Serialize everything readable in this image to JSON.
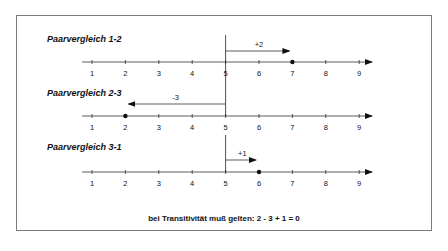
{
  "diagram": {
    "panels": [
      {
        "title": "Paarvergleich 1-2",
        "label": "+2",
        "start": 5,
        "end": 7,
        "point": 7
      },
      {
        "title": "Paarvergleich 2-3",
        "label": "-3",
        "start": 5,
        "end": 2,
        "point": 2
      },
      {
        "title": "Paarvergleich 3-1",
        "label": "+1",
        "start": 5,
        "end": 6,
        "point": 6
      }
    ],
    "ticks": [
      "1",
      "2",
      "3",
      "4",
      "5",
      "6",
      "7",
      "8",
      "9"
    ],
    "note": "bei Transitivität muß gelten: 2 - 3 + 1 = 0"
  }
}
